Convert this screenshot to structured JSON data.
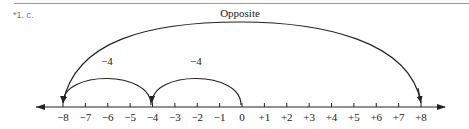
{
  "header": {
    "question_label": "*1. c."
  },
  "diagram": {
    "type": "number-line",
    "range": [
      -8,
      8
    ],
    "ticks": [
      "−8",
      "−7",
      "−6",
      "−5",
      "−4",
      "−3",
      "−2",
      "−1",
      "0",
      "+1",
      "+2",
      "+3",
      "+4",
      "+5",
      "+6",
      "+7",
      "+8"
    ],
    "arcs": [
      {
        "from": 0,
        "to": -4,
        "label": "−4"
      },
      {
        "from": -4,
        "to": -8,
        "label": "−4"
      },
      {
        "from": 8,
        "to": -8,
        "label": "Opposite",
        "bidirectional": true
      }
    ],
    "labels": {
      "opposite": "Opposite",
      "jump1": "−4",
      "jump2": "−4"
    }
  }
}
